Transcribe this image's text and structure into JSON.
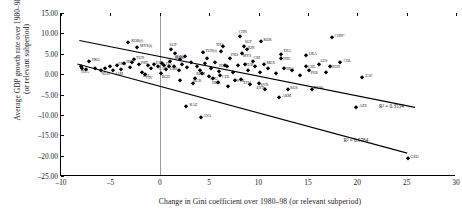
{
  "chart_data": {
    "type": "scatter",
    "title": "",
    "xlabel": "Change in Gini coefficient over 1980–98 (or relevant subperiod)",
    "ylabel": "Average GDP growth rate over 1980–98\n(or relevant subperiod)",
    "xlim": [
      -10,
      30
    ],
    "ylim": [
      -25,
      15
    ],
    "xticks": [
      "–10",
      "–5",
      "0",
      "5",
      "10",
      "15",
      "20",
      "25",
      "30"
    ],
    "xtick_values": [
      -10,
      -5,
      0,
      5,
      10,
      15,
      20,
      25,
      30
    ],
    "yticks": [
      "15.00",
      "10.00",
      "5.00",
      "0.00",
      "–5.00",
      "–10.00",
      "–15.00",
      "–20.00",
      "–25.00"
    ],
    "ytick_values": [
      15,
      10,
      5,
      0,
      -5,
      -10,
      -15,
      -20,
      -25
    ],
    "grid": false,
    "legend": "none",
    "reference_line_x": 0,
    "trendlines": [
      {
        "name": "upper-trendline",
        "x0": -8.2,
        "y0": 8.2,
        "x1": 26.0,
        "y1": -8.3,
        "r2_label": "R² = 0.3534",
        "r2_x": 22.2,
        "r2_y": -7.0
      },
      {
        "name": "lower-trendline",
        "x0": -8.4,
        "y0": 2.4,
        "x1": 25.2,
        "y1": -19.6,
        "r2_label": "R² = 0.5784",
        "r2_x": 18.6,
        "r2_y": -15.4
      }
    ],
    "points": [
      {
        "label": "HKG",
        "x": -7.2,
        "y": 3.1,
        "dx": 3,
        "dy": -1
      },
      {
        "label": "THA",
        "x": -7.9,
        "y": 1.6,
        "dx": -1,
        "dy": 4
      },
      {
        "label": "NLD",
        "x": -6.0,
        "y": 1.1,
        "dx": 1,
        "dy": 4
      },
      {
        "label": "JAM",
        "x": -4.7,
        "y": 0.9,
        "dx": 2,
        "dy": 4
      },
      {
        "label": "FRA",
        "x": -4.3,
        "y": 2.3,
        "dx": 1,
        "dy": -1
      },
      {
        "label": "KOR(t)",
        "x": -3.2,
        "y": 7.9,
        "dx": 3,
        "dy": -1
      },
      {
        "label": "MYS(t)",
        "x": -2.3,
        "y": 6.6,
        "dx": 3,
        "dy": -1
      },
      {
        "label": "TUN",
        "x": -2.6,
        "y": 3.6,
        "dx": 2,
        "dy": -1
      },
      {
        "label": "IRL",
        "x": -3.6,
        "y": 2.7,
        "dx": 2,
        "dy": -1
      },
      {
        "label": "PRT",
        "x": -2.1,
        "y": 2.4,
        "dx": 2,
        "dy": -1
      },
      {
        "label": "BEL",
        "x": -1.8,
        "y": 0.6,
        "dx": 1,
        "dy": 4
      },
      {
        "label": "CIV",
        "x": -1.5,
        "y": 0.1,
        "dx": 1,
        "dy": 4
      },
      {
        "label": "SGP",
        "x": 1.1,
        "y": 6.2,
        "dx": -1,
        "dy": -4
      },
      {
        "label": "IDN",
        "x": 1.5,
        "y": 5.1,
        "dx": 1,
        "dy": 4
      },
      {
        "label": "ESP",
        "x": -0.6,
        "y": 2.6,
        "dx": 2,
        "dy": -1
      },
      {
        "label": "CAN",
        "x": -0.2,
        "y": 2.1,
        "dx": 1,
        "dy": 3
      },
      {
        "label": "ITA",
        "x": 0.4,
        "y": 2.3,
        "dx": 2,
        "dy": -1
      },
      {
        "label": "BGD",
        "x": 0.1,
        "y": 0.3,
        "dx": 1,
        "dy": 4
      },
      {
        "label": "GBR",
        "x": 0.9,
        "y": 2.0,
        "dx": 1,
        "dy": 3
      },
      {
        "label": "RUSb",
        "x": 2.1,
        "y": 3.7,
        "dx": -6,
        "dy": -1
      },
      {
        "label": "TUN(t)",
        "x": 4.4,
        "y": 5.4,
        "dx": 2,
        "dy": -1
      },
      {
        "label": "THA",
        "x": 6.4,
        "y": 7.0,
        "dx": -7,
        "dy": -1
      },
      {
        "label": "CHN",
        "x": 8.1,
        "y": 9.3,
        "dx": -1,
        "dy": -4
      },
      {
        "label": "KOR",
        "x": 10.3,
        "y": 8.2,
        "dx": 2,
        "dy": -1
      },
      {
        "label": "SGP",
        "x": 8.5,
        "y": 6.9,
        "dx": 1,
        "dy": -4
      },
      {
        "label": "IDN",
        "x": 8.8,
        "y": 6.1,
        "dx": 1,
        "dy": -1
      },
      {
        "label": "MYS",
        "x": 8.3,
        "y": 5.2,
        "dx": 1,
        "dy": 3
      },
      {
        "label": "IND",
        "x": 7.1,
        "y": 4.0,
        "dx": 1,
        "dy": -3
      },
      {
        "label": "CHN*",
        "x": 17.4,
        "y": 9.2,
        "dx": 3,
        "dy": -1
      },
      {
        "label": "LKA",
        "x": 14.8,
        "y": 4.8,
        "dx": 3,
        "dy": -1
      },
      {
        "label": "THA",
        "x": 12.3,
        "y": 5.0,
        "dx": 2,
        "dy": -3
      },
      {
        "label": "PHL",
        "x": 12.3,
        "y": 3.9,
        "dx": 2,
        "dy": 1
      },
      {
        "label": "MEX",
        "x": 10.6,
        "y": 2.6,
        "dx": 2,
        "dy": -1
      },
      {
        "label": "COL",
        "x": 18.3,
        "y": 3.0,
        "dx": 3,
        "dy": -1
      },
      {
        "label": "CRI",
        "x": 9.4,
        "y": 3.2,
        "dx": 1,
        "dy": -3
      },
      {
        "label": "TUR",
        "x": 8.6,
        "y": 2.6,
        "dx": 1,
        "dy": 1
      },
      {
        "label": "BRA",
        "x": 12.6,
        "y": 1.4,
        "dx": 2,
        "dy": 1
      },
      {
        "label": "CHL",
        "x": 14.8,
        "y": 2.0,
        "dx": 2,
        "dy": 1
      },
      {
        "label": "AUS",
        "x": 16.1,
        "y": 2.4,
        "dx": 1,
        "dy": -3
      },
      {
        "label": "HON",
        "x": 17.2,
        "y": 1.9,
        "dx": 2,
        "dy": 1
      },
      {
        "label": "PER",
        "x": 15.1,
        "y": 0.9,
        "dx": 2,
        "dy": 3
      },
      {
        "label": "ZAF",
        "x": 20.5,
        "y": -0.6,
        "dx": 3,
        "dy": -1
      },
      {
        "label": "ECU",
        "x": 5.0,
        "y": -0.5,
        "dx": 1,
        "dy": 3
      },
      {
        "label": "SVK",
        "x": 7.6,
        "y": -1.5,
        "dx": 2,
        "dy": 1
      },
      {
        "label": "HUN",
        "x": 5.9,
        "y": -1.9,
        "dx": -6,
        "dy": 1
      },
      {
        "label": "KAZ",
        "x": 2.7,
        "y": -7.9,
        "dx": 3,
        "dy": -1
      },
      {
        "label": "LVA",
        "x": 4.2,
        "y": -10.4,
        "dx": 3,
        "dy": -1
      },
      {
        "label": "ESTb",
        "x": 10.7,
        "y": -3.7,
        "dx": -9,
        "dy": -1
      },
      {
        "label": "RUS",
        "x": 13.0,
        "y": -3.6,
        "dx": 2,
        "dy": -1
      },
      {
        "label": "RUSb",
        "x": 15.4,
        "y": -3.6,
        "dx": 2,
        "dy": -1
      },
      {
        "label": "ARM",
        "x": 12.1,
        "y": -5.6,
        "dx": 3,
        "dy": -1
      },
      {
        "label": "LTU",
        "x": 9.1,
        "y": -2.4,
        "dx": -6,
        "dy": -1
      },
      {
        "label": "AZE",
        "x": 19.9,
        "y": -8.1,
        "dx": 3,
        "dy": -1
      },
      {
        "label": "GEO",
        "x": 25.1,
        "y": -20.6,
        "dx": 3,
        "dy": -1
      },
      {
        "label": "POL",
        "x": 6.6,
        "y": 2.2,
        "dx": -6,
        "dy": 1
      },
      {
        "label": "ROM",
        "x": 4.3,
        "y": 0.2,
        "dx": -6,
        "dy": 1
      },
      {
        "label": "BGR",
        "x": 3.6,
        "y": -0.9,
        "dx": -2,
        "dy": 3
      },
      {
        "label": "SVN",
        "x": 10.0,
        "y": -2.3,
        "dx": 2,
        "dy": 2
      },
      {
        "label": "CZE",
        "x": 6.1,
        "y": -0.3,
        "dx": 2,
        "dy": 2
      },
      {
        "label": "",
        "x": -8.0,
        "y": 1.9,
        "dx": 0,
        "dy": 0
      },
      {
        "label": "",
        "x": -7.5,
        "y": 1.2,
        "dx": 0,
        "dy": 0
      },
      {
        "label": "",
        "x": -6.6,
        "y": 1.6,
        "dx": 0,
        "dy": 0
      },
      {
        "label": "",
        "x": -5.5,
        "y": 1.4,
        "dx": 0,
        "dy": 0
      },
      {
        "label": "",
        "x": -5.0,
        "y": 2.0,
        "dx": 0,
        "dy": 0
      },
      {
        "label": "",
        "x": -3.9,
        "y": 1.3,
        "dx": 0,
        "dy": 0
      },
      {
        "label": "",
        "x": -3.0,
        "y": 1.8,
        "dx": 0,
        "dy": 0
      },
      {
        "label": "",
        "x": -2.8,
        "y": 2.9,
        "dx": 0,
        "dy": 0
      },
      {
        "label": "",
        "x": -1.2,
        "y": 2.2,
        "dx": 0,
        "dy": 0
      },
      {
        "label": "",
        "x": -0.9,
        "y": 1.5,
        "dx": 0,
        "dy": 0
      },
      {
        "label": "",
        "x": 0.2,
        "y": 2.8,
        "dx": 0,
        "dy": 0
      },
      {
        "label": "",
        "x": 0.6,
        "y": 1.2,
        "dx": 0,
        "dy": 0
      },
      {
        "label": "",
        "x": 1.0,
        "y": 3.3,
        "dx": 0,
        "dy": 0
      },
      {
        "label": "",
        "x": 1.4,
        "y": 2.1,
        "dx": 0,
        "dy": 0
      },
      {
        "label": "",
        "x": 1.9,
        "y": 1.0,
        "dx": 0,
        "dy": 0
      },
      {
        "label": "",
        "x": 2.3,
        "y": 2.6,
        "dx": 0,
        "dy": 0
      },
      {
        "label": "",
        "x": 2.8,
        "y": 1.7,
        "dx": 0,
        "dy": 0
      },
      {
        "label": "",
        "x": 3.2,
        "y": 3.0,
        "dx": 0,
        "dy": 0
      },
      {
        "label": "",
        "x": 3.8,
        "y": 2.0,
        "dx": 0,
        "dy": 0
      },
      {
        "label": "",
        "x": 4.1,
        "y": 1.1,
        "dx": 0,
        "dy": 0
      },
      {
        "label": "",
        "x": 4.6,
        "y": 2.7,
        "dx": 0,
        "dy": 0
      },
      {
        "label": "",
        "x": 5.2,
        "y": 1.5,
        "dx": 0,
        "dy": 0
      },
      {
        "label": "",
        "x": 5.6,
        "y": 2.9,
        "dx": 0,
        "dy": 0
      },
      {
        "label": "",
        "x": 6.0,
        "y": 0.7,
        "dx": 0,
        "dy": 0
      },
      {
        "label": "",
        "x": 6.8,
        "y": 1.9,
        "dx": 0,
        "dy": 0
      },
      {
        "label": "",
        "x": 7.4,
        "y": 0.4,
        "dx": 0,
        "dy": 0
      },
      {
        "label": "",
        "x": 7.9,
        "y": 2.2,
        "dx": 0,
        "dy": 0
      },
      {
        "label": "",
        "x": 8.9,
        "y": 1.0,
        "dx": 0,
        "dy": 0
      },
      {
        "label": "",
        "x": 9.6,
        "y": 2.0,
        "dx": 0,
        "dy": 0
      },
      {
        "label": "",
        "x": 10.2,
        "y": 0.6,
        "dx": 0,
        "dy": 0
      },
      {
        "label": "",
        "x": 11.0,
        "y": 1.6,
        "dx": 0,
        "dy": 0
      },
      {
        "label": "",
        "x": 11.8,
        "y": 0.2,
        "dx": 0,
        "dy": 0
      },
      {
        "label": "",
        "x": 13.4,
        "y": 1.1,
        "dx": 0,
        "dy": 0
      },
      {
        "label": "",
        "x": 14.2,
        "y": -0.2,
        "dx": 0,
        "dy": 0
      },
      {
        "label": "",
        "x": 16.8,
        "y": 0.4,
        "dx": 0,
        "dy": 0
      },
      {
        "label": "",
        "x": 2.0,
        "y": -1.4,
        "dx": 0,
        "dy": 0
      },
      {
        "label": "",
        "x": 3.4,
        "y": -2.2,
        "dx": 0,
        "dy": 0
      },
      {
        "label": "",
        "x": 5.4,
        "y": -1.0,
        "dx": 0,
        "dy": 0
      },
      {
        "label": "",
        "x": 6.9,
        "y": -2.8,
        "dx": 0,
        "dy": 0
      },
      {
        "label": "",
        "x": 8.2,
        "y": -1.2,
        "dx": 0,
        "dy": 0
      },
      {
        "label": "",
        "x": 4.8,
        "y": 4.0,
        "dx": 0,
        "dy": 0
      },
      {
        "label": "",
        "x": 2.6,
        "y": 4.4,
        "dx": 0,
        "dy": 0
      },
      {
        "label": "",
        "x": 6.2,
        "y": 5.6,
        "dx": 0,
        "dy": 0
      }
    ]
  }
}
